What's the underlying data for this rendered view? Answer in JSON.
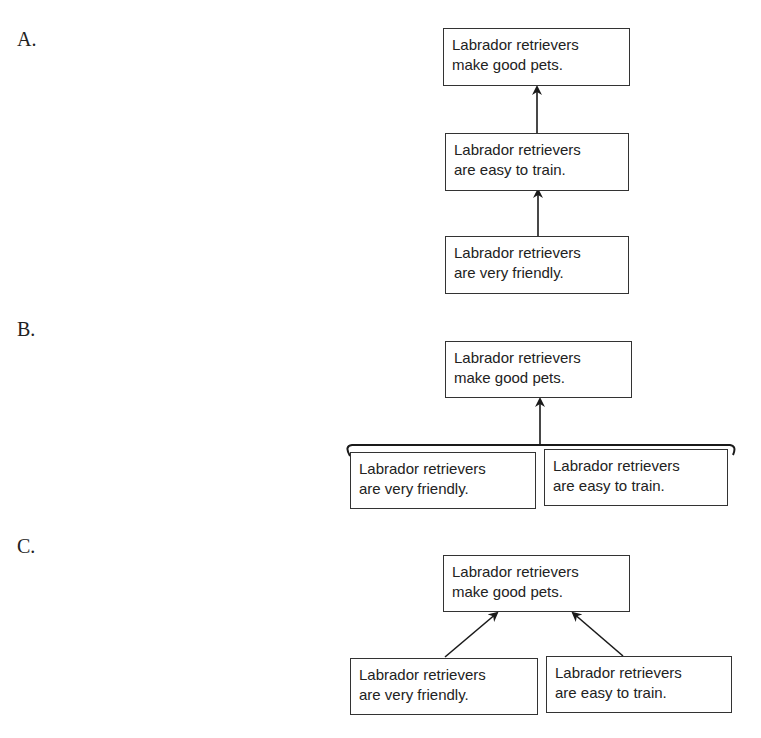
{
  "labels": {
    "a": "A.",
    "b": "B.",
    "c": "C."
  },
  "diagram_a": {
    "top": {
      "line1": "Labrador retrievers",
      "line2": "make good pets."
    },
    "middle": {
      "line1": "Labrador retrievers",
      "line2": "are easy to train."
    },
    "bottom": {
      "line1": "Labrador retrievers",
      "line2": "are very friendly."
    }
  },
  "diagram_b": {
    "top": {
      "line1": "Labrador retrievers",
      "line2": "make good pets."
    },
    "left": {
      "line1": "Labrador retrievers",
      "line2": "are very friendly."
    },
    "right": {
      "line1": "Labrador retrievers",
      "line2": "are easy to train."
    }
  },
  "diagram_c": {
    "top": {
      "line1": "Labrador retrievers",
      "line2": "make good pets."
    },
    "left": {
      "line1": "Labrador retrievers",
      "line2": "are very friendly."
    },
    "right": {
      "line1": "Labrador retrievers",
      "line2": "are easy to train."
    }
  }
}
